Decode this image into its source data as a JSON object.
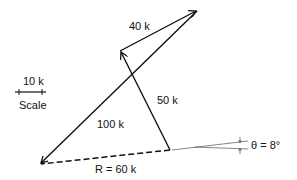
{
  "diagram": {
    "type": "vector-addition",
    "vectors": [
      {
        "label": "50 k",
        "from": [
          170,
          150
        ],
        "to": [
          120,
          51
        ]
      },
      {
        "label": "40 k",
        "from": [
          120,
          51
        ],
        "to": [
          197,
          11
        ]
      },
      {
        "label": "100 k",
        "from": [
          197,
          11
        ],
        "to": [
          40,
          164
        ]
      }
    ],
    "resultant": {
      "label": "R = 60 k",
      "from": [
        170,
        150
      ],
      "to": [
        40,
        164
      ],
      "style": "dashed"
    },
    "angle": {
      "label": "θ = 8°"
    },
    "scale": {
      "value_label": "10 k",
      "caption": "Scale"
    }
  }
}
